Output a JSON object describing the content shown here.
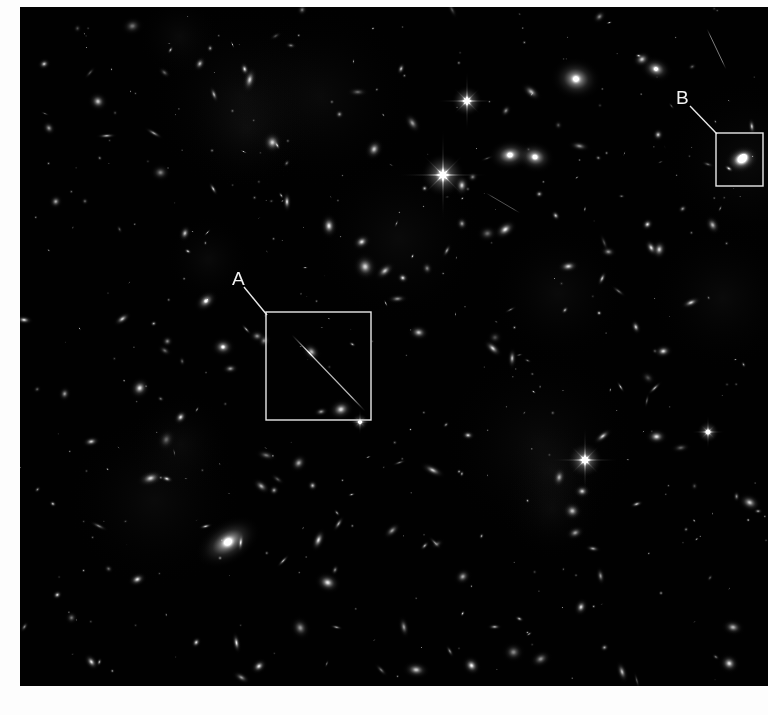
{
  "image": {
    "kind": "deep-field-astronomical-image",
    "background_color": "#010101",
    "page_background_color": "#fdfdfd",
    "plate": {
      "left": 20,
      "top": 7,
      "width": 748,
      "height": 679
    }
  },
  "annotations": {
    "stroke_color": "#e8e8e8",
    "stroke_width": 1.4,
    "label_color": "#f2f2f2",
    "label_font_size": 19,
    "items": [
      {
        "id": "A",
        "label": "A",
        "label_x": 212,
        "label_y": 278,
        "leader": {
          "x1": 224,
          "y1": 280,
          "x2": 247,
          "y2": 308
        },
        "box": {
          "x": 246,
          "y": 305,
          "width": 105,
          "height": 108
        },
        "contents": "thin diagonal streak / edge-on galaxy"
      },
      {
        "id": "B",
        "label": "B",
        "label_x": 656,
        "label_y": 97,
        "leader": {
          "x1": 670,
          "y1": 99,
          "x2": 697,
          "y2": 127
        },
        "box": {
          "x": 696,
          "y": 126,
          "width": 47,
          "height": 53
        },
        "contents": "bright interacting spiral galaxy"
      }
    ]
  },
  "sky": {
    "streaks": [
      {
        "x1": 272,
        "y1": 328,
        "x2": 345,
        "y2": 404,
        "width": 1.15,
        "opacity": 0.82
      },
      {
        "x1": 687,
        "y1": 22,
        "x2": 706,
        "y2": 62,
        "width": 1.0,
        "opacity": 0.55
      },
      {
        "x1": 466,
        "y1": 186,
        "x2": 500,
        "y2": 206,
        "width": 0.9,
        "opacity": 0.4
      }
    ],
    "spike_stars": [
      {
        "cx": 447,
        "cy": 94,
        "r": 7,
        "len": 30,
        "core": 1.0
      },
      {
        "cx": 423,
        "cy": 168,
        "r": 10,
        "len": 46,
        "core": 1.0
      },
      {
        "cx": 565,
        "cy": 453,
        "r": 8,
        "len": 34,
        "core": 1.0
      },
      {
        "cx": 688,
        "cy": 425,
        "r": 5,
        "len": 17,
        "core": 0.9
      },
      {
        "cx": 340,
        "cy": 415,
        "r": 4,
        "len": 13,
        "core": 0.8
      }
    ],
    "big_galaxies": [
      {
        "cx": 208,
        "cy": 535,
        "rx": 36,
        "ry": 22,
        "rot": -32,
        "peak": 0.95,
        "halo": 0.5
      },
      {
        "cx": 556,
        "cy": 72,
        "rx": 26,
        "ry": 22,
        "rot": 10,
        "peak": 0.9,
        "halo": 0.45
      },
      {
        "cx": 490,
        "cy": 148,
        "rx": 22,
        "ry": 16,
        "rot": -8,
        "peak": 0.95,
        "halo": 0.5
      },
      {
        "cx": 515,
        "cy": 150,
        "rx": 20,
        "ry": 16,
        "rot": 14,
        "peak": 0.95,
        "halo": 0.45
      },
      {
        "cx": 636,
        "cy": 62,
        "rx": 17,
        "ry": 13,
        "rot": 20,
        "peak": 0.9,
        "halo": 0.4
      },
      {
        "cx": 186,
        "cy": 294,
        "rx": 14,
        "ry": 10,
        "rot": -40,
        "peak": 0.85,
        "halo": 0.35
      },
      {
        "cx": 203,
        "cy": 340,
        "rx": 13,
        "ry": 11,
        "rot": 0,
        "peak": 0.85,
        "halo": 0.35
      },
      {
        "cx": 722,
        "cy": 152,
        "rx": 16,
        "ry": 13,
        "rot": -25,
        "peak": 1.0,
        "halo": 0.42
      }
    ],
    "galaxy_count": 260,
    "point_source_count": 180
  }
}
